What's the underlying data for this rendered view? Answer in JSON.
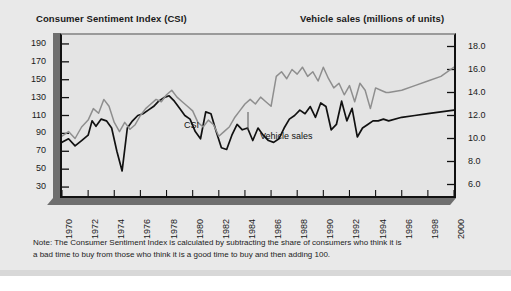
{
  "figure": {
    "title_left": "Consumer Sentiment Index (CSI)",
    "title_right": "Vehicle sales (millions of units)",
    "note_line1": "Note: The Consumer Sentiment Index is calculated by subtracting the share of consumers who think it is",
    "note_line2": "a bad time to buy from those who think it is a good time to buy and then adding 100.",
    "colors": {
      "card_background": "#e9e9e9",
      "plot_background": "#e4e4e4",
      "frame": "#111111",
      "frame_slab": "#6f6f6f",
      "csi_line": "#111111",
      "vehicle_sales_line": "#8e8e8e",
      "text": "#1a1a1a"
    }
  },
  "chart_data": {
    "type": "line",
    "title": "",
    "xlabel": "",
    "ylabel": "Consumer Sentiment Index (CSI)",
    "y2label": "Vehicle sales (millions of units)",
    "grid": false,
    "legend": "inline-annotations",
    "xlim": [
      1970,
      2000
    ],
    "ylim": [
      20,
      200
    ],
    "y2lim": [
      5.0,
      19.0
    ],
    "yticks": [
      190,
      170,
      150,
      130,
      110,
      90,
      70,
      50,
      30
    ],
    "y2ticks": [
      "18.0",
      "16.0",
      "14.0",
      "12.0",
      "10.0",
      "8.0",
      "6.0"
    ],
    "xticks": [
      1970,
      1972,
      1974,
      1976,
      1978,
      1980,
      1982,
      1984,
      1986,
      1988,
      1990,
      1992,
      1994,
      1996,
      1998,
      2000
    ],
    "annotations": [
      {
        "text": "CSI",
        "x": 1973.3,
        "axis": "left"
      },
      {
        "text": "Vehicle sales",
        "x": 1979.6,
        "axis": "right"
      }
    ],
    "series": [
      {
        "name": "CSI",
        "axis": "left",
        "color": "#111111",
        "x": [
          1970.0,
          1970.5,
          1971.0,
          1971.5,
          1972.0,
          1972.3,
          1972.6,
          1973.0,
          1973.4,
          1973.8,
          1974.2,
          1974.6,
          1975.0,
          1975.4,
          1975.8,
          1976.2,
          1976.6,
          1977.0,
          1977.4,
          1977.8,
          1978.2,
          1978.6,
          1979.0,
          1979.4,
          1979.8,
          1980.2,
          1980.6,
          1981.0,
          1981.4,
          1981.8,
          1982.2,
          1982.6,
          1983.0,
          1983.4,
          1983.8,
          1984.2,
          1984.6,
          1985.0,
          1985.4,
          1985.8,
          1986.2,
          1986.6,
          1987.0,
          1987.4,
          1987.8,
          1988.2,
          1988.6,
          1989.0,
          1989.4,
          1989.8,
          1990.2,
          1990.6,
          1991.0,
          1991.4,
          1991.8,
          1992.2,
          1992.6,
          1993.0,
          1993.4,
          1993.8,
          1994.2,
          1994.6,
          1995.0,
          1996.0,
          1997.0,
          1998.0,
          1999.0,
          2000.0
        ],
        "y": [
          80,
          84,
          76,
          82,
          88,
          104,
          98,
          106,
          104,
          96,
          70,
          48,
          96,
          104,
          110,
          112,
          116,
          120,
          126,
          130,
          132,
          126,
          118,
          110,
          106,
          92,
          84,
          114,
          112,
          92,
          74,
          72,
          88,
          100,
          94,
          96,
          82,
          96,
          88,
          82,
          80,
          84,
          96,
          106,
          110,
          116,
          112,
          120,
          108,
          124,
          120,
          94,
          100,
          126,
          104,
          118,
          86,
          96,
          100,
          104,
          104,
          106,
          104,
          108,
          110,
          112,
          114,
          116
        ]
      },
      {
        "name": "Vehicle sales",
        "axis": "right",
        "color": "#8e8e8e",
        "x": [
          1970.0,
          1970.5,
          1971.0,
          1971.5,
          1972.0,
          1972.4,
          1972.8,
          1973.2,
          1973.6,
          1974.0,
          1974.4,
          1974.8,
          1975.2,
          1975.6,
          1976.0,
          1976.4,
          1976.8,
          1977.2,
          1977.6,
          1978.0,
          1978.4,
          1978.8,
          1979.2,
          1979.6,
          1980.0,
          1980.4,
          1980.8,
          1981.2,
          1981.6,
          1982.0,
          1982.4,
          1982.8,
          1983.2,
          1983.6,
          1984.0,
          1984.4,
          1984.8,
          1985.2,
          1985.6,
          1986.0,
          1986.4,
          1986.8,
          1987.2,
          1987.6,
          1988.0,
          1988.4,
          1988.8,
          1989.2,
          1989.6,
          1990.0,
          1990.4,
          1990.8,
          1991.2,
          1991.6,
          1992.0,
          1992.4,
          1992.8,
          1993.2,
          1993.6,
          1994.0,
          1994.4,
          1994.8,
          1995.0,
          1996.0,
          1997.0,
          1998.0,
          1999.0,
          2000.0
        ],
        "y": [
          10.2,
          10.6,
          10.0,
          11.0,
          11.6,
          12.6,
          12.2,
          13.4,
          12.8,
          11.4,
          10.6,
          11.4,
          10.8,
          11.2,
          12.0,
          12.6,
          13.0,
          13.4,
          13.2,
          13.8,
          14.2,
          13.6,
          13.2,
          12.8,
          12.4,
          11.4,
          11.0,
          11.6,
          11.2,
          10.2,
          10.6,
          11.0,
          11.8,
          12.4,
          13.0,
          13.4,
          13.0,
          13.6,
          13.2,
          12.8,
          15.4,
          15.8,
          15.2,
          16.0,
          15.6,
          16.2,
          15.4,
          15.8,
          15.0,
          16.2,
          15.2,
          14.4,
          14.8,
          13.8,
          14.6,
          13.2,
          14.8,
          14.2,
          12.6,
          14.4,
          14.2,
          14.0,
          14.0,
          14.2,
          14.6,
          15.0,
          15.4,
          16.2
        ]
      }
    ]
  }
}
